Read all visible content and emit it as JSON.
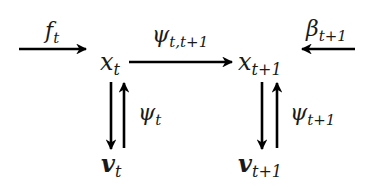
{
  "diagram": {
    "type": "commutative-diagram",
    "nodes": [
      {
        "id": "x_t",
        "base": "x",
        "sub": "t",
        "bold": false
      },
      {
        "id": "x_t1",
        "base": "x",
        "sub": "t+1",
        "bold": false
      },
      {
        "id": "v_t",
        "base": "v",
        "sub": "t",
        "bold": true
      },
      {
        "id": "v_t1",
        "base": "v",
        "sub": "t+1",
        "bold": true
      }
    ],
    "edges": [
      {
        "id": "f_t",
        "from": "input-left",
        "to": "x_t",
        "label_base": "f",
        "label_sub": "t"
      },
      {
        "id": "psi_tt1",
        "from": "x_t",
        "to": "x_t1",
        "label_base": "ψ",
        "label_sub": "t,t+1"
      },
      {
        "id": "beta_t1",
        "from": "input-right",
        "to": "x_t1",
        "label_base": "β",
        "label_sub": "t+1"
      },
      {
        "id": "x_t_to_v_t",
        "from": "x_t",
        "to": "v_t",
        "label_base": "",
        "label_sub": ""
      },
      {
        "id": "psi_t",
        "from": "v_t",
        "to": "x_t",
        "label_base": "ψ",
        "label_sub": "t"
      },
      {
        "id": "x_t1_to_v_t1",
        "from": "x_t1",
        "to": "v_t1",
        "label_base": "",
        "label_sub": ""
      },
      {
        "id": "psi_t1",
        "from": "v_t1",
        "to": "x_t1",
        "label_base": "ψ",
        "label_sub": "t+1"
      }
    ],
    "colors": {
      "stroke": "#000000",
      "text": "#1a1a1a",
      "background": "#ffffff"
    }
  }
}
